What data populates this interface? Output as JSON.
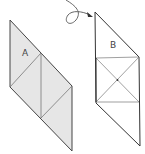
{
  "diagram": {
    "panels": [
      {
        "id": "A",
        "label": "A",
        "fill": "#e6e6e6"
      },
      {
        "id": "B",
        "label": "B",
        "fill": "#ffffff"
      }
    ],
    "arrow": {
      "description": "curved flip arrow from A to B"
    },
    "stroke": "#333333"
  }
}
